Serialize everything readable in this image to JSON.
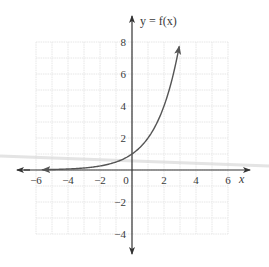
{
  "chart_data": {
    "type": "line",
    "title": "",
    "function_label": "y = f(x)",
    "function": "f(x) = 2^x",
    "xlabel": "x",
    "ylabel": "y = f(x)",
    "xlim": [
      -6,
      6
    ],
    "ylim": [
      -4,
      8
    ],
    "grid": true,
    "grid_step": 1,
    "x_ticks": [
      -6,
      -4,
      -2,
      0,
      2,
      4,
      6
    ],
    "x_tick_labels": [
      "−6",
      "−4",
      "−2",
      "0",
      "2",
      "4",
      "6"
    ],
    "y_ticks": [
      8,
      6,
      4,
      2,
      -2,
      -4
    ],
    "y_tick_labels": [
      "8",
      "6",
      "4",
      "2",
      "−2",
      "−4"
    ],
    "series": [
      {
        "name": "f(x)",
        "x": [
          -5.6,
          -5,
          -4,
          -3,
          -2,
          -1,
          0,
          1,
          2,
          2.5,
          2.95
        ],
        "values": [
          0.02,
          0.03,
          0.06,
          0.125,
          0.25,
          0.5,
          1,
          2,
          4,
          5.66,
          7.73
        ]
      }
    ],
    "annotations": [
      "arrowheads at both ends of curve",
      "arrowheads on both axes"
    ],
    "colors": {
      "curve": "#555555",
      "axis": "#333333",
      "grid": "#e6e6e6",
      "artifact_band": "#d9d9d9"
    }
  }
}
